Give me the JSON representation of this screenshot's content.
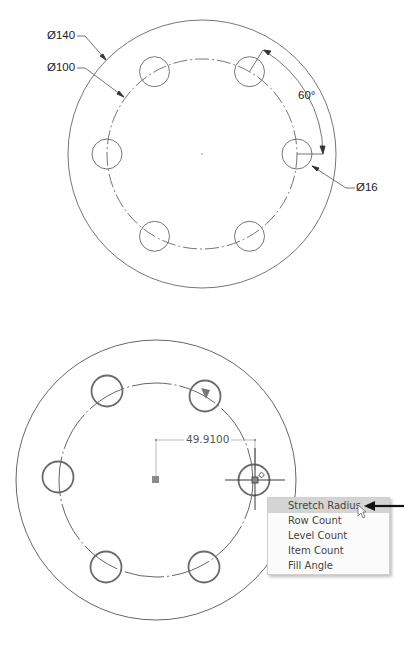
{
  "top_drawing": {
    "labels": {
      "outer_diameter": "Ø140",
      "bolt_circle_diameter": "Ø100",
      "angle": "60°",
      "hole_diameter": "Ø16"
    },
    "hole_count": 6
  },
  "bottom_drawing": {
    "radius_dimension": "49.9100",
    "context_menu": {
      "items": [
        {
          "label": "Stretch Radius",
          "highlighted": true
        },
        {
          "label": "Row Count",
          "highlighted": false
        },
        {
          "label": "Level Count",
          "highlighted": false
        },
        {
          "label": "Item Count",
          "highlighted": false
        },
        {
          "label": "Fill Angle",
          "highlighted": false
        }
      ]
    },
    "icons": [
      "square-grip-icon",
      "triangle-grip-icon",
      "crosshair-cursor-icon",
      "pointer-cursor-icon",
      "callout-arrow-icon"
    ]
  },
  "colors": {
    "line": "#555555",
    "hole_stroke_bottom": "#6a6a6a",
    "grip": "#8a8a8a",
    "menu_highlight": "#d4d4d4"
  }
}
